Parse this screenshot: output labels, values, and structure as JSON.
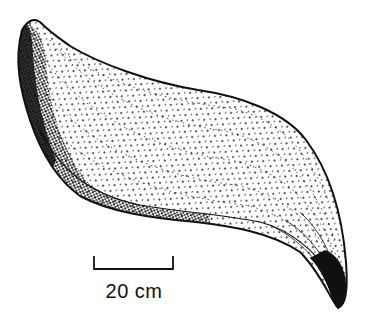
{
  "figure": {
    "ink_color": "#111111",
    "background": "#ffffff"
  },
  "scale": {
    "label": "20 cm"
  }
}
